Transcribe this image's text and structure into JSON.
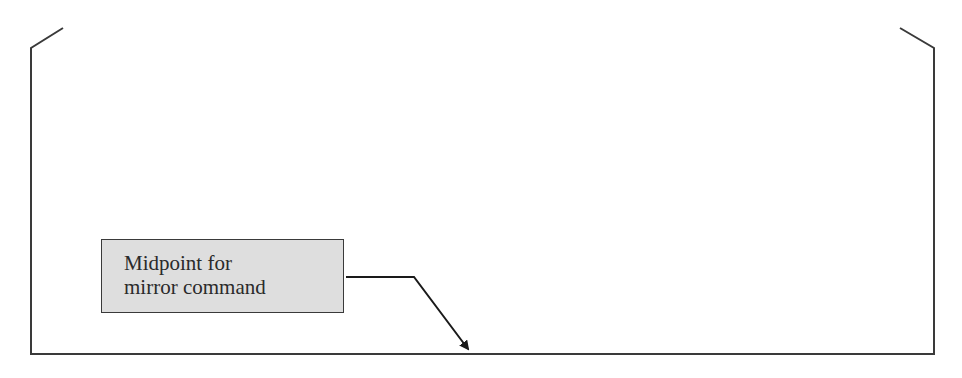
{
  "diagram": {
    "type": "outline-with-callout",
    "callout": {
      "line1": "Midpoint for",
      "line2": "mirror command",
      "fill_color": "#dedede",
      "border_color": "#3a3a3a"
    },
    "outline": {
      "stroke_color": "#3a3a3a",
      "points": [
        [
          63,
          28
        ],
        [
          31,
          48
        ],
        [
          31,
          354
        ],
        [
          934,
          354
        ],
        [
          934,
          48
        ],
        [
          900,
          28
        ]
      ]
    },
    "leader": {
      "points": [
        [
          346,
          277
        ],
        [
          414,
          277
        ],
        [
          470,
          351
        ]
      ],
      "arrowhead": "filled"
    }
  }
}
